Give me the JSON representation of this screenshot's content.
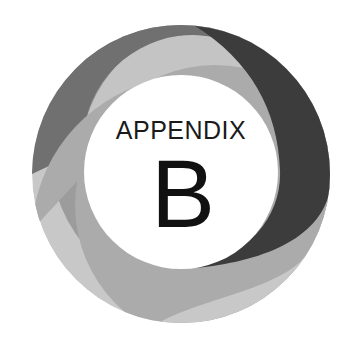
{
  "emblem": {
    "title": "APPENDIX",
    "letter": "B",
    "colors": {
      "background": "#ffffff",
      "dark_band": "#3c3c3c",
      "mid_band": "#707070",
      "left_band": "#9c9c9c",
      "inner_light_band": "#ababab",
      "bottom_band": "#c8c8c8",
      "center": "#ffffff",
      "text": "#111111"
    }
  }
}
